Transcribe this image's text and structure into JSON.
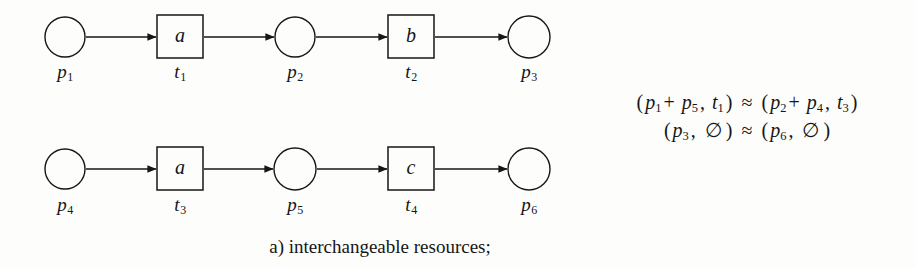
{
  "figure": {
    "caption": "a) interchangeable resources;",
    "ink_color": "#161616",
    "background_color": "#fdfdfc"
  },
  "diagram": {
    "type": "petri-net",
    "rows": [
      {
        "id": "top-row",
        "places": [
          {
            "id": "p1",
            "label": "p",
            "index": "1",
            "cx": 65,
            "cy": 37,
            "r": 20
          },
          {
            "id": "p2",
            "label": "p",
            "index": "2",
            "cx": 295,
            "cy": 37,
            "r": 20
          },
          {
            "id": "p3",
            "label": "p",
            "index": "3",
            "cx": 529,
            "cy": 37,
            "r": 21
          }
        ],
        "transitions": [
          {
            "id": "t1",
            "label": "t",
            "index": "1",
            "letter": "a",
            "x": 157,
            "y": 15,
            "w": 46,
            "h": 43
          },
          {
            "id": "t2",
            "label": "t",
            "index": "2",
            "letter": "b",
            "x": 388,
            "y": 15,
            "w": 46,
            "h": 43
          }
        ],
        "arcs": [
          {
            "from": "p1",
            "to": "t1",
            "x1": 86,
            "x2": 156,
            "y": 37
          },
          {
            "from": "t1",
            "to": "p2",
            "x1": 204,
            "x2": 274,
            "y": 37
          },
          {
            "from": "p2",
            "to": "t2",
            "x1": 316,
            "x2": 387,
            "y": 37
          },
          {
            "from": "t2",
            "to": "p3",
            "x1": 435,
            "x2": 507,
            "y": 37
          }
        ]
      },
      {
        "id": "bottom-row",
        "places": [
          {
            "id": "p4",
            "label": "p",
            "index": "4",
            "cx": 65,
            "cy": 169,
            "r": 20
          },
          {
            "id": "p5",
            "label": "p",
            "index": "5",
            "cx": 295,
            "cy": 169,
            "r": 21
          },
          {
            "id": "p6",
            "label": "p",
            "index": "6",
            "cx": 529,
            "cy": 169,
            "r": 21
          }
        ],
        "transitions": [
          {
            "id": "t3",
            "label": "t",
            "index": "3",
            "letter": "a",
            "x": 157,
            "y": 147,
            "w": 46,
            "h": 43
          },
          {
            "id": "t4",
            "label": "t",
            "index": "4",
            "letter": "c",
            "x": 388,
            "y": 147,
            "w": 46,
            "h": 43
          }
        ],
        "arcs": [
          {
            "from": "p4",
            "to": "t3",
            "x1": 86,
            "x2": 156,
            "y": 169
          },
          {
            "from": "t3",
            "to": "p5",
            "x1": 204,
            "x2": 274,
            "y": 169
          },
          {
            "from": "p5",
            "to": "t4",
            "x1": 317,
            "x2": 387,
            "y": 169
          },
          {
            "from": "t4",
            "to": "p6",
            "x1": 435,
            "x2": 507,
            "y": 169
          }
        ]
      }
    ],
    "node_labels": [
      {
        "id": "label-p1",
        "text": "p",
        "sub": "1",
        "x": 65,
        "y": 62
      },
      {
        "id": "label-t1",
        "text": "t",
        "sub": "1",
        "x": 180,
        "y": 62
      },
      {
        "id": "label-p2",
        "text": "p",
        "sub": "2",
        "x": 295,
        "y": 62
      },
      {
        "id": "label-t2",
        "text": "t",
        "sub": "2",
        "x": 411,
        "y": 62
      },
      {
        "id": "label-p3",
        "text": "p",
        "sub": "3",
        "x": 529,
        "y": 62
      },
      {
        "id": "label-p4",
        "text": "p",
        "sub": "4",
        "x": 65,
        "y": 195
      },
      {
        "id": "label-t3",
        "text": "t",
        "sub": "3",
        "x": 180,
        "y": 195
      },
      {
        "id": "label-p5",
        "text": "p",
        "sub": "5",
        "x": 295,
        "y": 195
      },
      {
        "id": "label-t4",
        "text": "t",
        "sub": "4",
        "x": 411,
        "y": 195
      },
      {
        "id": "label-p6",
        "text": "p",
        "sub": "6",
        "x": 529,
        "y": 195
      }
    ]
  },
  "relations": {
    "line1": {
      "left_open": "(",
      "term1": "p",
      "term1_sub": "1",
      "plus": "+",
      "term2": "p",
      "term2_sub": "5",
      "comma1": ",",
      "term3": "t",
      "term3_sub": "1",
      "left_close": ")",
      "relation_symbol": "≈",
      "right_open": "(",
      "term4": "p",
      "term4_sub": "2",
      "plus2": "+",
      "term5": "p",
      "term5_sub": "4",
      "comma2": ",",
      "term6": "t",
      "term6_sub": "3",
      "right_close": ")",
      "plain": "(p1 + p5, t1) ≈ (p2 + p4, t3)"
    },
    "line2": {
      "left_open": "(",
      "term1": "p",
      "term1_sub": "3",
      "comma1": ",",
      "empty1": "∅",
      "left_close": ")",
      "relation_symbol": "≈",
      "right_open": "(",
      "term2": "p",
      "term2_sub": "6",
      "comma2": ",",
      "empty2": "∅",
      "right_close": ")",
      "plain": "(p3, ∅) ≈ (p6, ∅)"
    }
  }
}
